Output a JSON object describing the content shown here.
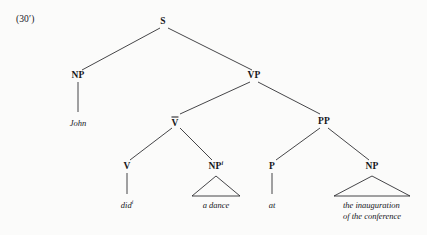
{
  "figure": {
    "example_label": "(30′)",
    "caption": "",
    "ink_color": "#17171a",
    "paper_color": "#fbfbfa"
  },
  "tree": {
    "nodes": {
      "s": {
        "label": "S",
        "superscript": "",
        "bar": false,
        "x": 163,
        "y": 22
      },
      "np_subj": {
        "label": "NP",
        "superscript": "",
        "bar": false,
        "x": 78,
        "y": 76
      },
      "vp": {
        "label": "VP",
        "superscript": "",
        "bar": false,
        "x": 254,
        "y": 76
      },
      "vbar": {
        "label": "V",
        "superscript": "",
        "bar": true,
        "x": 175,
        "y": 122
      },
      "pp": {
        "label": "PP",
        "superscript": "",
        "bar": false,
        "x": 324,
        "y": 122
      },
      "v": {
        "label": "V",
        "superscript": "",
        "bar": false,
        "x": 127,
        "y": 167
      },
      "np_obj": {
        "label": "NP",
        "superscript": "i",
        "bar": false,
        "x": 216,
        "y": 167
      },
      "p": {
        "label": "P",
        "superscript": "",
        "bar": false,
        "x": 272,
        "y": 167
      },
      "np_pobj": {
        "label": "NP",
        "superscript": "",
        "bar": false,
        "x": 372,
        "y": 167
      }
    },
    "leaves": {
      "john": {
        "text": "John",
        "superscript": "",
        "x": 78,
        "y": 118
      },
      "did": {
        "text": "did",
        "superscript": "i",
        "x": 127,
        "y": 200
      },
      "a_dance": {
        "text": "a dance",
        "superscript": "",
        "x": 216,
        "y": 200
      },
      "at": {
        "text": "at",
        "superscript": "",
        "x": 272,
        "y": 200
      },
      "inauguration": {
        "line1": "the inauguration",
        "line2": "of the conference",
        "x": 372,
        "y": 200
      }
    },
    "triangles": [
      {
        "name": "triangle-a-dance",
        "apex_x": 216,
        "apex_y": 176,
        "left_x": 192,
        "right_x": 240,
        "base_y": 196
      },
      {
        "name": "triangle-inauguration",
        "apex_x": 372,
        "apex_y": 176,
        "left_x": 334,
        "right_x": 410,
        "base_y": 196
      }
    ],
    "edges": [
      {
        "name": "edge-s-np",
        "x1": 160,
        "y1": 28,
        "x2": 82,
        "y2": 70
      },
      {
        "name": "edge-s-vp",
        "x1": 168,
        "y1": 28,
        "x2": 252,
        "y2": 70
      },
      {
        "name": "edge-np-john",
        "x1": 78,
        "y1": 82,
        "x2": 78,
        "y2": 112
      },
      {
        "name": "edge-vp-vbar",
        "x1": 250,
        "y1": 82,
        "x2": 180,
        "y2": 114
      },
      {
        "name": "edge-vp-pp",
        "x1": 258,
        "y1": 82,
        "x2": 320,
        "y2": 114
      },
      {
        "name": "edge-vbar-v",
        "x1": 172,
        "y1": 128,
        "x2": 130,
        "y2": 160
      },
      {
        "name": "edge-vbar-npobj",
        "x1": 180,
        "y1": 128,
        "x2": 212,
        "y2": 160
      },
      {
        "name": "edge-pp-p",
        "x1": 320,
        "y1": 128,
        "x2": 276,
        "y2": 160
      },
      {
        "name": "edge-pp-nppobj",
        "x1": 328,
        "y1": 128,
        "x2": 369,
        "y2": 160
      },
      {
        "name": "edge-v-did",
        "x1": 127,
        "y1": 173,
        "x2": 127,
        "y2": 194
      },
      {
        "name": "edge-p-at",
        "x1": 272,
        "y1": 173,
        "x2": 272,
        "y2": 194
      }
    ]
  }
}
